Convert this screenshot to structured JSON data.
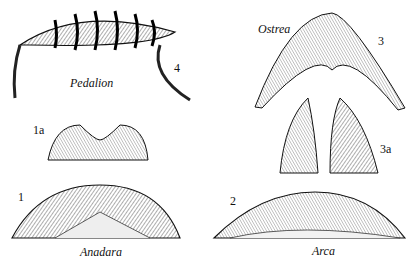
{
  "figure": {
    "panels": [
      {
        "number": "4",
        "genus": "Pedalion"
      },
      {
        "number": "1a",
        "genus": ""
      },
      {
        "number": "1",
        "genus": "Anadara"
      },
      {
        "number": "3",
        "genus": "Ostrea"
      },
      {
        "number": "3a",
        "genus": ""
      },
      {
        "number": "2",
        "genus": "Arca"
      }
    ]
  }
}
